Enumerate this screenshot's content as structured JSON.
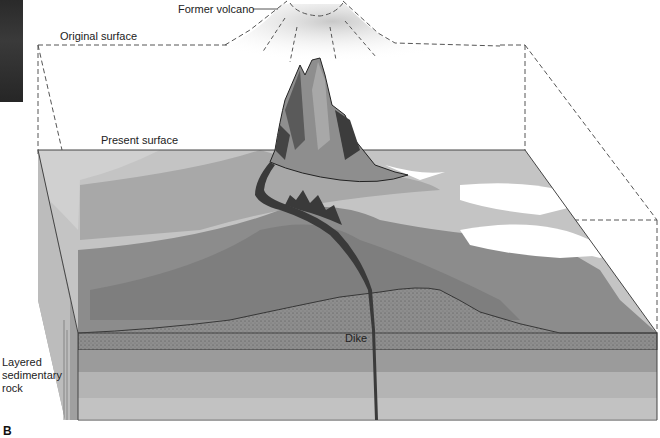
{
  "figure": {
    "panel_letter": "B",
    "labels": {
      "former_volcano": "Former volcano",
      "original_surface": "Original surface",
      "present_surface": "Present surface",
      "dike": "Dike",
      "layered_rock_line1": "Layered",
      "layered_rock_line2": "sedimentary",
      "layered_rock_line3": "rock"
    },
    "colors": {
      "background": "#ffffff",
      "dashed_outline": "#555555",
      "surface_light": "#c4c4c4",
      "surface_mid": "#9a9a9a",
      "surface_dark": "#7e7e7e",
      "stipple_layer": "#8c8c8c",
      "layer_1": "#9b9b9b",
      "layer_2": "#b4b4b4",
      "layer_3": "#c2c2c2",
      "dike": "#3a3a3a",
      "former_volcano_fill": "#d8d8d8"
    }
  }
}
